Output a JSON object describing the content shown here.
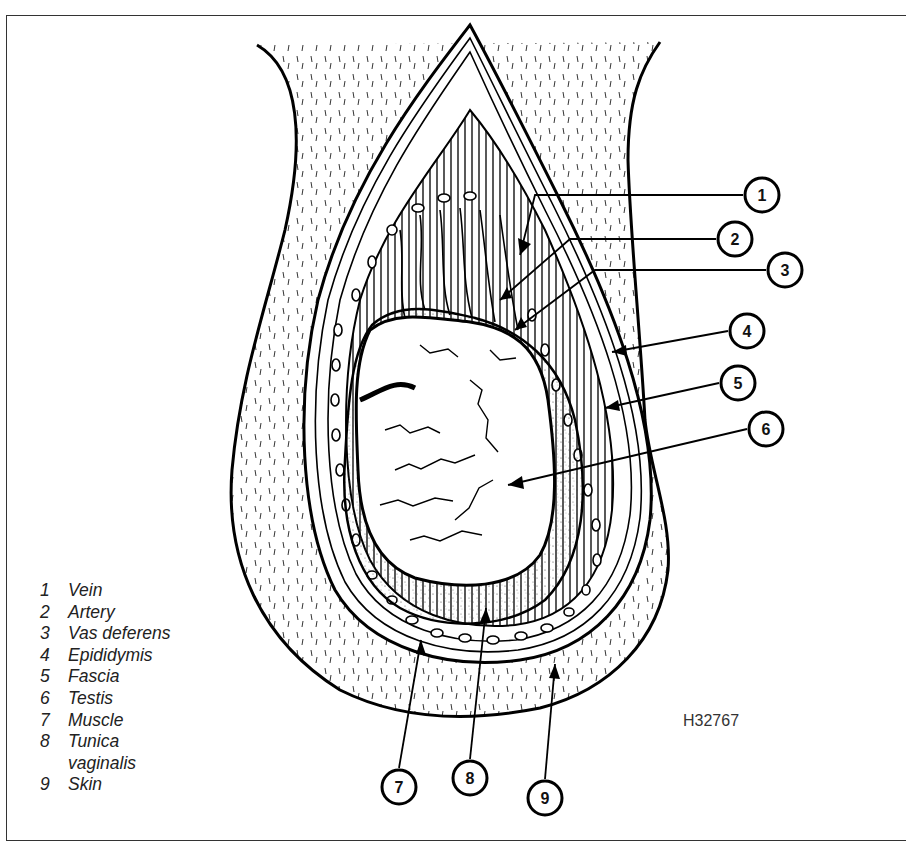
{
  "figure": {
    "id": "H32767"
  },
  "callouts": [
    {
      "num": "1",
      "label": "Vein",
      "cx": 762,
      "cy": 195,
      "tx": 520,
      "ty": 255
    },
    {
      "num": "2",
      "label": "Artery",
      "cx": 735,
      "cy": 239,
      "tx": 500,
      "ty": 300
    },
    {
      "num": "3",
      "label": "Vas deferens",
      "cx": 785,
      "cy": 270,
      "tx": 515,
      "ty": 330
    },
    {
      "num": "4",
      "label": "Epididymis",
      "cx": 747,
      "cy": 331,
      "tx": 612,
      "ty": 352
    },
    {
      "num": "5",
      "label": "Fascia",
      "cx": 738,
      "cy": 383,
      "tx": 605,
      "ty": 408
    },
    {
      "num": "6",
      "label": "Testis",
      "cx": 766,
      "cy": 429,
      "tx": 508,
      "ty": 485
    },
    {
      "num": "7",
      "label": "Muscle",
      "cx": 399,
      "cy": 787,
      "tx": 421,
      "ty": 640
    },
    {
      "num": "8",
      "label": "Tunica vaginalis",
      "cx": 470,
      "cy": 778,
      "tx": 486,
      "ty": 608
    },
    {
      "num": "9",
      "label": "Skin",
      "cx": 545,
      "cy": 798,
      "tx": 555,
      "ty": 664
    }
  ],
  "legend": [
    {
      "num": "1",
      "label": "Vein"
    },
    {
      "num": "2",
      "label": "Artery"
    },
    {
      "num": "3",
      "label": "Vas deferens"
    },
    {
      "num": "4",
      "label": "Epididymis"
    },
    {
      "num": "5",
      "label": "Fascia"
    },
    {
      "num": "6",
      "label": "Testis"
    },
    {
      "num": "7",
      "label": "Muscle"
    },
    {
      "num": "8",
      "label": "Tunica"
    },
    {
      "num": "",
      "label": "vaginalis"
    },
    {
      "num": "9",
      "label": "Skin"
    }
  ]
}
